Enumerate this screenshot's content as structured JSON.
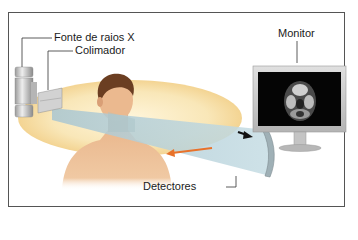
{
  "diagram": {
    "labels": {
      "xray_source": "Fonte de raios X",
      "collimator": "Colimador",
      "monitor": "Monitor",
      "detectors": "Detectores"
    },
    "colors": {
      "frame": "#555555",
      "orbit_ring": "#f6dfa8",
      "beam": "#b9d3dc",
      "skin": "#e8b58a",
      "hair": "#6b3e22",
      "rotation_arrow": "#e8722a",
      "signal_arrow": "#111111",
      "monitor_bezel": "#c9c9c9",
      "monitor_screen": "#050505",
      "source_metal": "#c8c8c8"
    },
    "monitor_image": "axial CT head slice"
  }
}
